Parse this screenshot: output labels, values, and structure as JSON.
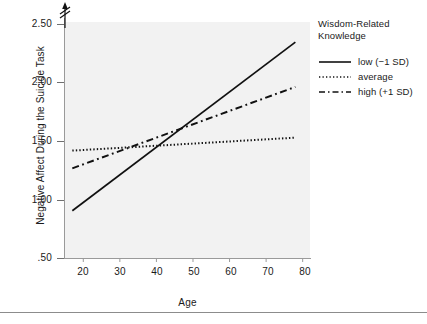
{
  "chart_data": {
    "type": "line",
    "title": "",
    "xlabel": "Age",
    "ylabel": "Negative Affect During the Suicide Task",
    "xlim": [
      15,
      82
    ],
    "ylim": [
      0.5,
      2.5
    ],
    "xticks": [
      "20",
      "30",
      "40",
      "50",
      "60",
      "70",
      "80"
    ],
    "xtick_values": [
      20,
      30,
      40,
      50,
      60,
      70,
      80
    ],
    "yticks": [
      ".50",
      "1.00",
      "1.50",
      "2.00",
      "2.50"
    ],
    "ytick_values": [
      0.5,
      1.0,
      1.5,
      2.0,
      2.5
    ],
    "grid": false,
    "y_axis_break": true,
    "legend_position": "right",
    "legend_title": "Wisdom-Related Knowledge",
    "x": [
      17,
      78
    ],
    "series": [
      {
        "name": "low (−1 SD)",
        "style": "solid",
        "values": [
          0.9,
          2.33
        ]
      },
      {
        "name": "average",
        "style": "dotted",
        "values": [
          1.41,
          1.52
        ]
      },
      {
        "name": "high (+1 SD)",
        "style": "dashed",
        "values": [
          1.26,
          1.95
        ]
      }
    ],
    "annotations": [
      "Lines converge near Age 40 at approximately 1.42"
    ]
  },
  "axis": {
    "y_title": "Negative Affect During the Suicide Task",
    "x_title": "Age",
    "y_tick_labels": [
      ".50",
      "1.00",
      "1.50",
      "2.00",
      "2.50"
    ],
    "x_tick_labels": [
      "20",
      "30",
      "40",
      "50",
      "60",
      "70",
      "80"
    ]
  },
  "legend": {
    "title_line1": "Wisdom-Related",
    "title_line2": "Knowledge",
    "items": [
      {
        "label": "low (−1 SD)",
        "style": "solid"
      },
      {
        "label": "average",
        "style": "dotted"
      },
      {
        "label": "high (+1 SD)",
        "style": "dashed"
      }
    ]
  },
  "colors": {
    "plot_background": "#f2f2f2",
    "line": "#111111",
    "axis": "#9a9a9a",
    "text": "#1a1a1a",
    "rule": "#8c8c8c"
  }
}
